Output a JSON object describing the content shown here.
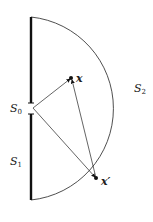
{
  "diagram": {
    "labels": {
      "s0": "S",
      "s0_sub": "0",
      "s1": "S",
      "s1_sub": "1",
      "s2": "S",
      "s2_sub": "2",
      "x": "x",
      "xprime": "x′"
    },
    "colors": {
      "stroke": "#111111",
      "background": "#ffffff"
    }
  }
}
